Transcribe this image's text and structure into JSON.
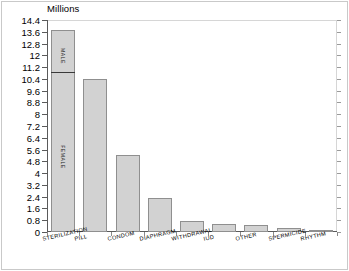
{
  "chart_data": {
    "type": "bar",
    "title": "",
    "subtitle": "",
    "axis_title": "Millions",
    "xlabel": "",
    "ylabel": "Millions",
    "ylim": [
      0,
      14.4
    ],
    "ytick_step": 0.8,
    "grid": false,
    "legend": "none",
    "categories": [
      "STERILIZATION",
      "PILL",
      "CONDOM",
      "DIAPHRAGM",
      "WITHDRAWAL",
      "IUD",
      "OTHER",
      "SPERMICIDE",
      "RHYTHM"
    ],
    "values": [
      13.7,
      10.4,
      5.2,
      2.3,
      0.75,
      0.52,
      0.45,
      0.25,
      0.15
    ],
    "ytick_labels": [
      "0",
      "0.8",
      "1.6",
      "2.4",
      "3.2",
      "4",
      "4.8",
      "5.6",
      "6.4",
      "7.2",
      "8",
      "8.8",
      "9.6",
      "10.4",
      "11.2",
      "12",
      "12.8",
      "13.6",
      "14.4"
    ],
    "ytick_values": [
      0,
      0.8,
      1.6,
      2.4,
      3.2,
      4,
      4.8,
      5.6,
      6.4,
      7.2,
      8,
      8.8,
      9.6,
      10.4,
      11.2,
      12,
      12.8,
      13.6,
      14.4
    ],
    "stacked_first_bar": {
      "category": "STERILIZATION",
      "total": 13.7,
      "segments": [
        {
          "name": "FEMALE",
          "label": "FEMALE",
          "value": 10.7,
          "from": 0,
          "to": 10.7
        },
        {
          "name": "MALE",
          "label": "MALE",
          "value": 3.0,
          "from": 10.7,
          "to": 13.7
        }
      ]
    },
    "colors": {
      "bar_fill": "#d2d2d2",
      "bar_border": "#8f8f8f",
      "segment_divider": "#3a3a3a",
      "axis": "#5a5a5a",
      "text": "#000000",
      "background": "#ffffff",
      "frame": "#c9c9c9"
    }
  }
}
